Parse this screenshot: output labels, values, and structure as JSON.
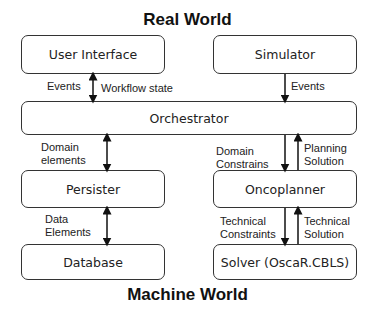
{
  "titles": {
    "top": "Real World",
    "bottom": "Machine World"
  },
  "components": {
    "user_interface": "User Interface",
    "simulator": "Simulator",
    "orchestrator": "Orchestrator",
    "persister": "Persister",
    "oncoplanner": "Oncoplanner",
    "database": "Database",
    "solver": "Solver (OscaR.CBLS)"
  },
  "edges": {
    "ui_orchestrator": {
      "left_label": "Events",
      "right_label": "Workflow state",
      "direction": "bidirectional"
    },
    "simulator_orchestrator": {
      "label": "Events",
      "direction": "down"
    },
    "orchestrator_persister": {
      "label_line1": "Domain",
      "label_line2": "elements",
      "direction": "bidirectional"
    },
    "orchestrator_oncoplanner_down": {
      "label_line1": "Domain",
      "label_line2": "Constrains",
      "direction": "down"
    },
    "oncoplanner_orchestrator_up": {
      "label_line1": "Planning",
      "label_line2": "Solution",
      "direction": "up"
    },
    "persister_database": {
      "label_line1": "Data",
      "label_line2": "Elements",
      "direction": "bidirectional"
    },
    "oncoplanner_solver_down": {
      "label_line1": "Technical",
      "label_line2": "Constraints",
      "direction": "down"
    },
    "solver_oncoplanner_up": {
      "label_line1": "Technical",
      "label_line2": "Solution",
      "direction": "up"
    }
  }
}
